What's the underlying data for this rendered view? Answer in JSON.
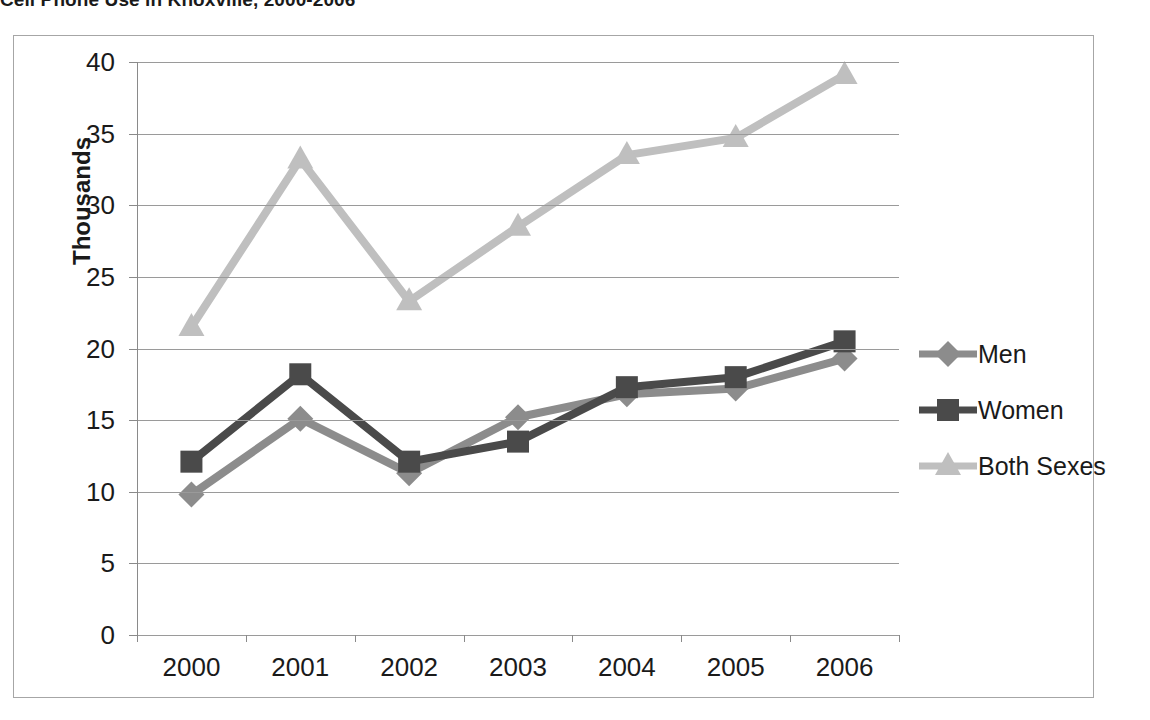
{
  "title": "Cell Phone Use in Knoxville, 2000-2006",
  "chart_data": {
    "type": "line",
    "title": "Cell Phone Use in Knoxville, 2000-2006",
    "xlabel": "",
    "ylabel": "Thousands",
    "categories": [
      "2000",
      "2001",
      "2002",
      "2003",
      "2004",
      "2005",
      "2006"
    ],
    "series": [
      {
        "name": "Men",
        "color": "#8c8c8c",
        "marker": "diamond",
        "values": [
          9.8,
          15.1,
          11.3,
          15.2,
          16.8,
          17.2,
          19.3
        ]
      },
      {
        "name": "Women",
        "color": "#4a4a4a",
        "marker": "square",
        "values": [
          12.1,
          18.2,
          12.1,
          13.5,
          17.3,
          18.0,
          20.5
        ]
      },
      {
        "name": "Both Sexes",
        "color": "#bfbfbf",
        "marker": "triangle",
        "values": [
          21.5,
          33.2,
          23.3,
          28.5,
          33.5,
          34.7,
          39.1
        ]
      }
    ],
    "ylim": [
      0,
      40
    ],
    "yticks": [
      0,
      5,
      10,
      15,
      20,
      25,
      30,
      35,
      40
    ],
    "ytick_labels": [
      "0",
      "5",
      "10",
      "15",
      "20",
      "25",
      "30",
      "35",
      "40"
    ],
    "grid": true,
    "grid_axis": "y",
    "legend_position": "right"
  },
  "legend": {
    "items": [
      {
        "label": "Men"
      },
      {
        "label": "Women"
      },
      {
        "label": "Both Sexes"
      }
    ]
  },
  "axes": {
    "y_title": "Thousands"
  },
  "colors": {
    "men": "#8c8c8c",
    "women": "#4a4a4a",
    "both": "#bfbfbf",
    "grid": "#9a9a9a",
    "axis": "#8a8a8a",
    "frame": "#a6a6a6",
    "text": "#1a1a1a"
  }
}
